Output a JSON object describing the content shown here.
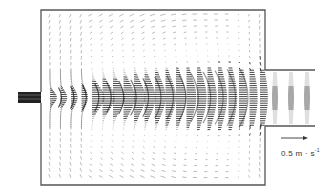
{
  "figure": {
    "type": "velocity-vector-field",
    "scale_arrow": {
      "value": "0.5",
      "unit_main": "m · s",
      "unit_exp": "-1",
      "label": "0.5 m · s⁻¹"
    },
    "colors": {
      "vectors": "#1a1a1a",
      "walls": "#555555",
      "background": "#ffffff"
    },
    "geometry": {
      "chamber": {
        "x": 41,
        "y": 10,
        "w": 224,
        "h": 175
      },
      "inlet": {
        "x": 18,
        "y": 92,
        "w": 23,
        "h": 11
      },
      "outlet": {
        "x": 265,
        "y": 70,
        "w": 50,
        "h": 56
      }
    }
  }
}
